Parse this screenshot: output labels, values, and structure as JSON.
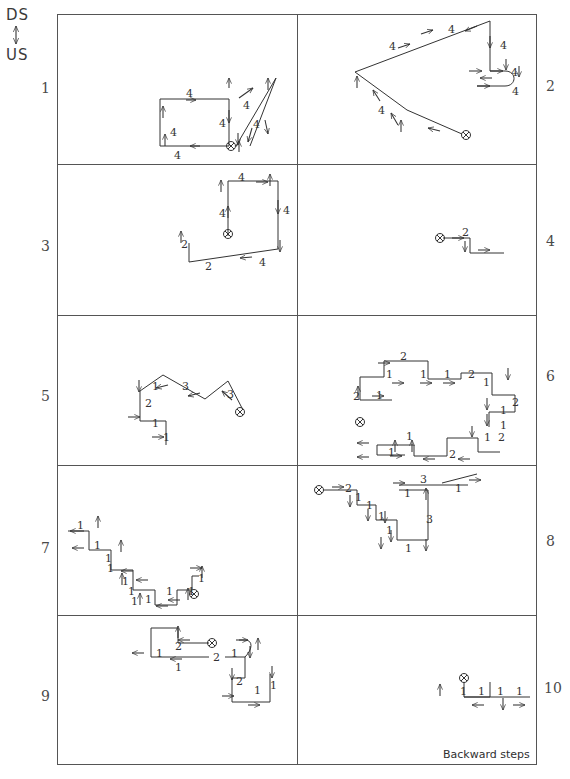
{
  "figure": {
    "axis": {
      "top_label": "DS",
      "bottom_label": "US",
      "arrow_icon": "double-arrow-vertical-icon"
    },
    "caption": "Backward steps",
    "grid": {
      "rows": 5,
      "cols": 2
    },
    "panel_numbers_left": [
      "1",
      "3",
      "5",
      "7",
      "9"
    ],
    "panel_numbers_right": [
      "2",
      "4",
      "6",
      "8",
      "10"
    ],
    "panels": [
      {
        "id": "panel-1",
        "number": "1",
        "side": "left",
        "labels": [
          "4",
          "4",
          "4",
          "4",
          "4",
          "4"
        ],
        "start_marker": "crossed-circle-marker"
      },
      {
        "id": "panel-2",
        "number": "2",
        "side": "right",
        "labels": [
          "4",
          "4",
          "4",
          "4",
          "4",
          "4"
        ],
        "start_marker": "crossed-circle-marker"
      },
      {
        "id": "panel-3",
        "number": "3",
        "side": "left",
        "labels": [
          "4",
          "4",
          "4",
          "4",
          "2",
          "2"
        ],
        "start_marker": "crossed-circle-marker"
      },
      {
        "id": "panel-4",
        "number": "4",
        "side": "right",
        "labels": [
          "2"
        ],
        "start_marker": "crossed-circle-marker"
      },
      {
        "id": "panel-5",
        "number": "5",
        "side": "left",
        "labels": [
          "1",
          "3",
          "3",
          "2",
          "1",
          "1"
        ],
        "start_marker": "crossed-circle-marker"
      },
      {
        "id": "panel-6",
        "number": "6",
        "side": "right",
        "labels": [
          "2",
          "1",
          "1",
          "1",
          "2",
          "1",
          "2",
          "1",
          "1",
          "2",
          "1",
          "1",
          "1",
          "2",
          "2",
          "1"
        ],
        "start_marker": "crossed-circle-marker"
      },
      {
        "id": "panel-7",
        "number": "7",
        "side": "left",
        "labels": [
          "1",
          "1",
          "1",
          "1",
          "1",
          "1",
          "1",
          "1",
          "1",
          "1",
          "1"
        ],
        "start_marker": "crossed-circle-marker"
      },
      {
        "id": "panel-8",
        "number": "8",
        "side": "right",
        "labels": [
          "2",
          "1",
          "1",
          "1",
          "1",
          "1",
          "3",
          "3",
          "1",
          "1"
        ],
        "start_marker": "crossed-circle-marker"
      },
      {
        "id": "panel-9",
        "number": "9",
        "side": "left",
        "labels": [
          "1",
          "2",
          "1",
          "2",
          "1",
          "2",
          "1",
          "1"
        ],
        "start_marker": "crossed-circle-marker"
      },
      {
        "id": "panel-10",
        "number": "10",
        "side": "right",
        "labels": [
          "1",
          "1",
          "1",
          "1"
        ],
        "start_marker": "crossed-circle-marker"
      }
    ]
  }
}
